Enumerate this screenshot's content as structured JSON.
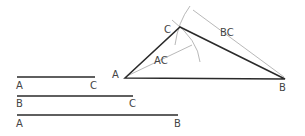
{
  "diagram": {
    "colors": {
      "line": "#2a2a2a",
      "construction": "#9a9a9a",
      "label": "#444444"
    },
    "given_segments": [
      {
        "name": "AC",
        "start_label": "A",
        "end_label": "C"
      },
      {
        "name": "BC",
        "start_label": "B",
        "end_label": "C"
      },
      {
        "name": "AB",
        "start_label": "A",
        "end_label": "B"
      }
    ],
    "triangle": {
      "vertex_a": "A",
      "vertex_b": "B",
      "vertex_c": "C",
      "radius_label_ac": "AC",
      "radius_label_bc": "BC"
    }
  }
}
